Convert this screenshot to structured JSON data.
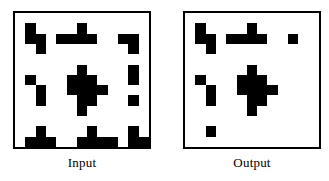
{
  "figure": {
    "background": "#ffffff",
    "cell_color": "#000000",
    "frame_color": "#000000"
  },
  "panels": [
    {
      "id": "input",
      "caption": "Input",
      "rows": 13,
      "cols": 13,
      "grid": [
        [
          0,
          0,
          0,
          0,
          0,
          0,
          0,
          0,
          0,
          0,
          0,
          0,
          0
        ],
        [
          0,
          1,
          0,
          0,
          0,
          0,
          1,
          0,
          0,
          0,
          0,
          0,
          0
        ],
        [
          0,
          1,
          1,
          0,
          1,
          1,
          1,
          1,
          0,
          0,
          1,
          1,
          0
        ],
        [
          0,
          0,
          1,
          0,
          0,
          0,
          0,
          0,
          0,
          0,
          0,
          1,
          0
        ],
        [
          0,
          0,
          0,
          0,
          0,
          0,
          0,
          0,
          0,
          0,
          0,
          0,
          0
        ],
        [
          0,
          0,
          0,
          0,
          0,
          0,
          1,
          0,
          0,
          0,
          0,
          1,
          0
        ],
        [
          0,
          1,
          0,
          0,
          0,
          1,
          1,
          1,
          0,
          0,
          0,
          1,
          0
        ],
        [
          0,
          0,
          1,
          0,
          0,
          1,
          1,
          1,
          1,
          0,
          0,
          0,
          0
        ],
        [
          0,
          0,
          1,
          0,
          0,
          0,
          1,
          1,
          0,
          0,
          0,
          1,
          0
        ],
        [
          0,
          0,
          0,
          0,
          0,
          0,
          1,
          0,
          0,
          0,
          0,
          0,
          0
        ],
        [
          0,
          0,
          0,
          0,
          0,
          0,
          0,
          0,
          0,
          0,
          0,
          0,
          0
        ],
        [
          0,
          0,
          1,
          0,
          0,
          0,
          0,
          1,
          0,
          0,
          0,
          1,
          0
        ],
        [
          0,
          1,
          1,
          1,
          0,
          0,
          1,
          1,
          1,
          1,
          0,
          1,
          1
        ]
      ]
    },
    {
      "id": "output",
      "caption": "Output",
      "rows": 13,
      "cols": 13,
      "grid": [
        [
          0,
          0,
          0,
          0,
          0,
          0,
          0,
          0,
          0,
          0,
          0,
          0,
          0
        ],
        [
          0,
          1,
          0,
          0,
          0,
          0,
          1,
          0,
          0,
          0,
          0,
          0,
          0
        ],
        [
          0,
          1,
          1,
          0,
          1,
          1,
          1,
          1,
          0,
          0,
          1,
          0,
          0
        ],
        [
          0,
          0,
          1,
          0,
          0,
          0,
          0,
          0,
          0,
          0,
          0,
          0,
          0
        ],
        [
          0,
          0,
          0,
          0,
          0,
          0,
          0,
          0,
          0,
          0,
          0,
          0,
          0
        ],
        [
          0,
          0,
          0,
          0,
          0,
          0,
          1,
          0,
          0,
          0,
          0,
          0,
          0
        ],
        [
          0,
          1,
          0,
          0,
          0,
          1,
          1,
          1,
          0,
          0,
          0,
          0,
          0
        ],
        [
          0,
          0,
          1,
          0,
          0,
          1,
          1,
          1,
          1,
          0,
          0,
          0,
          0
        ],
        [
          0,
          0,
          1,
          0,
          0,
          0,
          1,
          1,
          0,
          0,
          0,
          0,
          0
        ],
        [
          0,
          0,
          0,
          0,
          0,
          0,
          1,
          0,
          0,
          0,
          0,
          0,
          0
        ],
        [
          0,
          0,
          0,
          0,
          0,
          0,
          0,
          0,
          0,
          0,
          0,
          0,
          0
        ],
        [
          0,
          0,
          1,
          0,
          0,
          0,
          0,
          0,
          0,
          0,
          0,
          0,
          0
        ],
        [
          0,
          0,
          0,
          0,
          0,
          0,
          0,
          0,
          0,
          0,
          0,
          0,
          0
        ]
      ]
    }
  ]
}
